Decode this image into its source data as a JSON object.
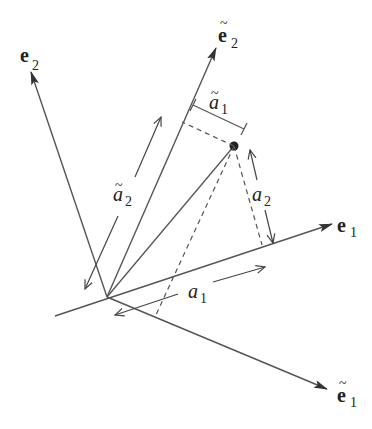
{
  "diagram": {
    "title": "",
    "colors": {
      "line": "#555555",
      "text": "#222222",
      "background": "#ffffff"
    },
    "origin": {
      "x": 107,
      "y": 297
    },
    "point": {
      "x": 234,
      "y": 146
    },
    "axes": [
      {
        "id": "e1",
        "label_main": "e",
        "label_sub": "1",
        "tilde": false,
        "start": [
          55,
          316
        ],
        "tip": [
          332,
          224
        ],
        "label_pos": [
          337,
          232
        ]
      },
      {
        "id": "e2",
        "label_main": "e",
        "label_sub": "2",
        "tilde": false,
        "start": [
          107,
          297
        ],
        "tip": [
          31,
          72
        ],
        "label_pos": [
          20,
          60
        ]
      },
      {
        "id": "e1_tilde",
        "label_main": "e",
        "label_sub": "1",
        "tilde": true,
        "start": [
          107,
          297
        ],
        "tip": [
          327,
          389
        ],
        "label_pos": [
          337,
          402
        ]
      },
      {
        "id": "e2_tilde",
        "label_main": "e",
        "label_sub": "2",
        "tilde": true,
        "start": [
          107,
          297
        ],
        "tip": [
          216,
          48
        ],
        "label_pos": [
          218,
          42
        ]
      }
    ],
    "components": [
      {
        "id": "a1",
        "label_main": "a",
        "label_sub": "1",
        "tilde": false
      },
      {
        "id": "a2",
        "label_main": "a",
        "label_sub": "2",
        "tilde": false
      },
      {
        "id": "a1_tilde",
        "label_main": "a",
        "label_sub": "1",
        "tilde": true
      },
      {
        "id": "a2_tilde",
        "label_main": "a",
        "label_sub": "2",
        "tilde": true
      }
    ],
    "tilde_glyph": "~"
  }
}
